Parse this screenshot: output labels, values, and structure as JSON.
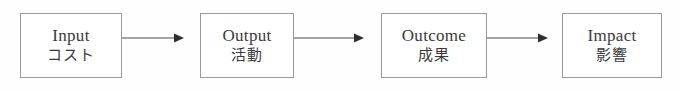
{
  "diagram": {
    "type": "logic-model-flow",
    "title": "",
    "orientation": "horizontal",
    "background_color": "#fefefe",
    "box_border_color": "#9a9a9e",
    "text_color": "#3a3a3d",
    "arrow_color": "#4a4a4e",
    "stages": [
      {
        "id": "input",
        "label_en": "Input",
        "label_ja": "コスト",
        "x": 20,
        "y": 13,
        "width": 102,
        "height": 65
      },
      {
        "id": "output",
        "label_en": "Output",
        "label_ja": "活動",
        "x": 200,
        "y": 13,
        "width": 94,
        "height": 65
      },
      {
        "id": "outcome",
        "label_en": "Outcome",
        "label_ja": "成果",
        "x": 381,
        "y": 13,
        "width": 106,
        "height": 65
      },
      {
        "id": "impact",
        "label_en": "Impact",
        "label_ja": "影響",
        "x": 562,
        "y": 13,
        "width": 100,
        "height": 65
      }
    ],
    "connectors": [
      {
        "id": "input-to-output",
        "from": "input",
        "to": "output",
        "x": 122,
        "y": 38,
        "length": 62,
        "arrowhead": "filled-triangle"
      },
      {
        "id": "output-to-outcome",
        "from": "output",
        "to": "outcome",
        "x": 294,
        "y": 38,
        "length": 70,
        "arrowhead": "filled-triangle"
      },
      {
        "id": "outcome-to-impact",
        "from": "outcome",
        "to": "impact",
        "x": 487,
        "y": 38,
        "length": 61,
        "arrowhead": "filled-triangle"
      }
    ]
  }
}
